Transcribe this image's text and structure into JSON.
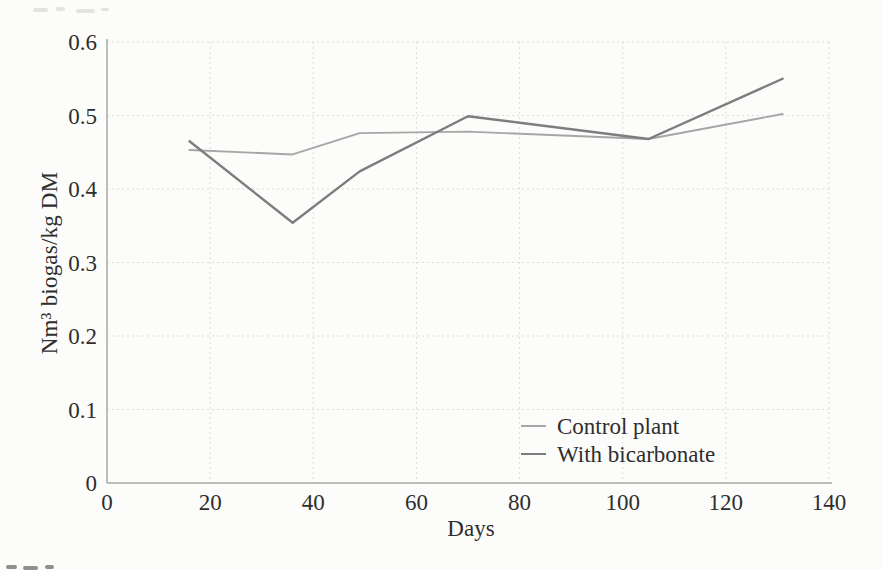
{
  "figure": {
    "background": "#fcfcfa"
  },
  "chart_data": {
    "type": "line",
    "title": "",
    "xlabel": "Days",
    "ylabel": "Nm³ biogas/kg DM",
    "xlim": [
      0,
      140
    ],
    "ylim": [
      0,
      0.6
    ],
    "x_ticks": [
      0,
      20,
      40,
      60,
      80,
      100,
      120,
      140
    ],
    "x_tick_labels": [
      "0",
      "20",
      "40",
      "60",
      "80",
      "100",
      "120",
      "140"
    ],
    "y_ticks": [
      0,
      0.1,
      0.2,
      0.3,
      0.4,
      0.5,
      0.6
    ],
    "y_tick_labels": [
      "0",
      "0.1",
      "0.2",
      "0.3",
      "0.4",
      "0.5",
      "0.6"
    ],
    "grid": true,
    "grid_style": "dotted",
    "grid_color": "#dbdbd7",
    "axis_color": "#a8a8a5",
    "text_color": "#2e2e2e",
    "legend_position": "inside-lower-right",
    "x": [
      16,
      36,
      49,
      70,
      105,
      131
    ],
    "series": [
      {
        "name": "Control plant",
        "color": "#a6a6a6",
        "stroke_width": 1.9,
        "values": [
          0.453,
          0.447,
          0.476,
          0.478,
          0.468,
          0.502
        ]
      },
      {
        "name": "With bicarbonate",
        "color": "#7d7d7d",
        "stroke_width": 2.4,
        "values": [
          0.465,
          0.354,
          0.424,
          0.499,
          0.468,
          0.55
        ]
      }
    ]
  }
}
